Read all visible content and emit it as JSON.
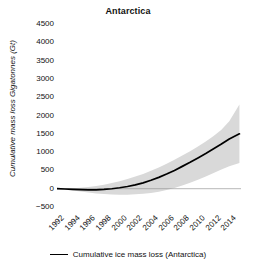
{
  "chart_data": {
    "type": "line",
    "title": "Antarctica",
    "xlabel": "",
    "ylabel": "Cumulative mass loss Gigatonnes (Gt)",
    "xlim": [
      1992,
      2015.5
    ],
    "ylim": [
      -500,
      4500
    ],
    "grid": false,
    "legend_position": "bottom",
    "x_tick_labels": [
      "1992",
      "1994",
      "1996",
      "1998",
      "2000",
      "2002",
      "2004",
      "2006",
      "2008",
      "2010",
      "2012",
      "2014"
    ],
    "x_tick_values": [
      1992,
      1994,
      1996,
      1998,
      2000,
      2002,
      2004,
      2006,
      2008,
      2010,
      2012,
      2014
    ],
    "y_tick_labels": [
      "−500",
      "0",
      "500",
      "1000",
      "1500",
      "2000",
      "2500",
      "3000",
      "3500",
      "4000",
      "4500"
    ],
    "y_tick_values": [
      -500,
      0,
      500,
      1000,
      1500,
      2000,
      2500,
      3000,
      3500,
      4000,
      4500
    ],
    "series": [
      {
        "name": "Cumulative ice mass loss (Antarctica)",
        "color": "#000000",
        "x": [
          1992,
          1993,
          1994,
          1995,
          1996,
          1997,
          1998,
          1999,
          2000,
          2001,
          2002,
          2003,
          2004,
          2005,
          2006,
          2007,
          2008,
          2009,
          2010,
          2011,
          2012,
          2013,
          2014,
          2015.3
        ],
        "values": [
          0,
          -8,
          -18,
          -26,
          -32,
          -30,
          -20,
          -2,
          25,
          60,
          105,
          160,
          230,
          310,
          400,
          500,
          610,
          720,
          840,
          960,
          1090,
          1220,
          1360,
          1500
        ]
      }
    ],
    "uncertainty_band": {
      "name": "uncertainty range",
      "color": "#d9d9d9",
      "x": [
        1992,
        1993,
        1994,
        1995,
        1996,
        1997,
        1998,
        1999,
        2000,
        2001,
        2002,
        2003,
        2004,
        2005,
        2006,
        2007,
        2008,
        2009,
        2010,
        2011,
        2012,
        2013,
        2014,
        2015.3
      ],
      "upper": [
        5,
        10,
        15,
        25,
        45,
        75,
        110,
        155,
        205,
        265,
        330,
        405,
        490,
        580,
        680,
        790,
        905,
        1025,
        1155,
        1290,
        1440,
        1610,
        1840,
        2300
      ],
      "lower": [
        -5,
        -26,
        -50,
        -76,
        -103,
        -128,
        -148,
        -160,
        -165,
        -163,
        -155,
        -140,
        -115,
        -80,
        -35,
        20,
        85,
        160,
        245,
        335,
        430,
        525,
        610,
        700
      ]
    }
  },
  "legend": {
    "entries": [
      {
        "label": "Cumulative ice mass loss (Antarctica)",
        "marker": "line-swatch"
      }
    ]
  }
}
